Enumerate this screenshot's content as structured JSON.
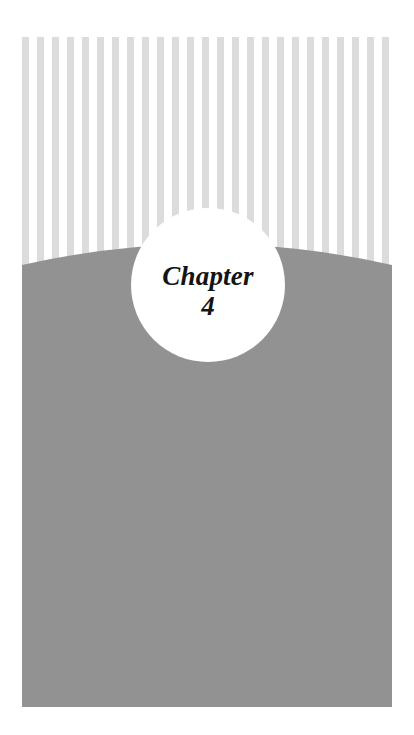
{
  "page": {
    "width": 414,
    "height": 735,
    "background_color": "#ffffff",
    "type": "book-chapter-divider"
  },
  "badge": {
    "chapter_label": "Chapter",
    "chapter_number": "4",
    "shape": "circle",
    "fill_color": "#ffffff",
    "text_color": "#141414",
    "diameter_px": 154,
    "center_x": 208,
    "center_y": 285
  },
  "stripes": {
    "name": "vertical-stripe-band",
    "color": "#dcdcdc",
    "background_color": "#ffffff",
    "count": 25,
    "stripe_width_px": 7,
    "gap_px": 8,
    "period_px": 15,
    "band_left": 22,
    "band_top": 37,
    "band_width": 370,
    "band_height": 232
  },
  "gray_panel": {
    "name": "gray-curved-panel",
    "color": "#929292",
    "left": 22,
    "top": 238,
    "width": 370,
    "height": 469,
    "curve_type": "convex-arc-top",
    "edge_top_y": 27,
    "apex_y": 6
  },
  "margins": {
    "left": 22,
    "right": 22,
    "top": 37,
    "bottom": 28
  }
}
